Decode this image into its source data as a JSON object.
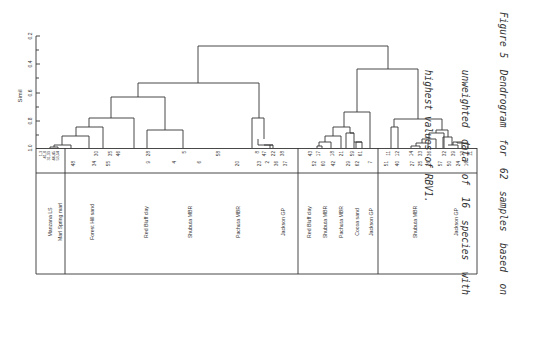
{
  "chart_data": {
    "type": "dendrogram",
    "title": "",
    "ylabel": "Simil",
    "xlabel": "",
    "yticks": [
      "0.2",
      "0.4",
      "0.6",
      "0.8",
      "1.0"
    ],
    "ylim": [
      0.2,
      1.0
    ],
    "grid": false,
    "orientation": "leaves at bottom; figure rotated 90° on page",
    "leaf_labels_row1": [
      "1,3,41,8,31,33,44,45,53,54",
      "30",
      "35",
      "46",
      "28",
      "5",
      "58",
      "8",
      "47",
      "22",
      "38",
      "43",
      "17",
      "18",
      "21",
      "59",
      "61",
      "11",
      "12",
      "14",
      "33",
      "36",
      "32",
      "39",
      "13",
      "11"
    ],
    "leaf_labels_row2": [
      "48",
      "34",
      "55",
      "9",
      "4",
      "6",
      "20",
      "23",
      "2",
      "36",
      "37",
      "52",
      "60",
      "42",
      "29",
      "62",
      "7",
      "51",
      "40",
      "27",
      "25",
      "26",
      "57",
      "50",
      "49",
      "58",
      "24",
      "16",
      "15"
    ],
    "groups": [
      {
        "section": "A",
        "label": "Manzana LS"
      },
      {
        "section": "A",
        "label": "Marl Spring marl"
      },
      {
        "section": "B",
        "label": "Forest Hill sand"
      },
      {
        "section": "B",
        "label": "Red Bluff clay"
      },
      {
        "section": "B",
        "label": "Shubuta MBR"
      },
      {
        "section": "B",
        "label": "Pachuta MBR"
      },
      {
        "section": "B",
        "label": "Jackson GP"
      },
      {
        "section": "C",
        "label": "Red Bluff clay"
      },
      {
        "section": "C",
        "label": "Shubuta MBR"
      },
      {
        "section": "C",
        "label": "Pachuta MBR"
      },
      {
        "section": "C",
        "label": "Cocoa sand"
      },
      {
        "section": "C",
        "label": "Jackson GP"
      },
      {
        "section": "D",
        "label": "Shubuta MBR"
      },
      {
        "section": "D",
        "label": "Jackson GP"
      }
    ],
    "major_merges": [
      {
        "description": "root (all samples)",
        "similarity": 0.27
      },
      {
        "description": "left cluster (sections A+B)",
        "similarity": 0.53
      },
      {
        "description": "right cluster (sections C+D)",
        "similarity": 0.43
      },
      {
        "description": "section C cluster",
        "similarity": 0.74
      },
      {
        "description": "section D cluster",
        "similarity": 0.78
      }
    ]
  },
  "axis": {
    "label": "Simil",
    "ticks": [
      "0.2",
      "0.4",
      "0.6",
      "0.8",
      "1.0"
    ]
  },
  "table": {
    "header_small": [
      "1,3",
      "41,8",
      "31,33",
      "44,45",
      "53,54"
    ],
    "row1": [
      {
        "x": 96,
        "t": "30"
      },
      {
        "x": 110,
        "t": "35"
      },
      {
        "x": 118,
        "t": "46"
      },
      {
        "x": 148,
        "t": "28"
      },
      {
        "x": 184,
        "t": "5"
      },
      {
        "x": 218,
        "t": "58"
      },
      {
        "x": 257,
        "t": "8"
      },
      {
        "x": 264,
        "t": "47"
      },
      {
        "x": 273,
        "t": "22"
      },
      {
        "x": 282,
        "t": "38"
      },
      {
        "x": 310,
        "t": "43"
      },
      {
        "x": 318,
        "t": "17"
      },
      {
        "x": 332,
        "t": "18"
      },
      {
        "x": 341,
        "t": "21"
      },
      {
        "x": 352,
        "t": "59"
      },
      {
        "x": 360,
        "t": "61"
      },
      {
        "x": 388,
        "t": "11"
      },
      {
        "x": 397,
        "t": "12"
      },
      {
        "x": 411,
        "t": "14"
      },
      {
        "x": 420,
        "t": "33"
      },
      {
        "x": 429,
        "t": "36"
      },
      {
        "x": 444,
        "t": "32"
      },
      {
        "x": 453,
        "t": "39"
      },
      {
        "x": 462,
        "t": "13"
      },
      {
        "x": 470,
        "t": "11"
      }
    ],
    "row2": [
      {
        "x": 73,
        "t": "48"
      },
      {
        "x": 94,
        "t": "34"
      },
      {
        "x": 108,
        "t": "55"
      },
      {
        "x": 148,
        "t": "9"
      },
      {
        "x": 174,
        "t": "4"
      },
      {
        "x": 199,
        "t": "6"
      },
      {
        "x": 237,
        "t": "20"
      },
      {
        "x": 259,
        "t": "23"
      },
      {
        "x": 267,
        "t": "2"
      },
      {
        "x": 276,
        "t": "36"
      },
      {
        "x": 285,
        "t": "37"
      },
      {
        "x": 314,
        "t": "52"
      },
      {
        "x": 323,
        "t": "60"
      },
      {
        "x": 333,
        "t": "42"
      },
      {
        "x": 348,
        "t": "29"
      },
      {
        "x": 357,
        "t": "62"
      },
      {
        "x": 370,
        "t": "7"
      },
      {
        "x": 386,
        "t": "51"
      },
      {
        "x": 397,
        "t": "40"
      },
      {
        "x": 412,
        "t": "27"
      },
      {
        "x": 420,
        "t": "25"
      },
      {
        "x": 428,
        "t": "26"
      },
      {
        "x": 440,
        "t": "57"
      },
      {
        "x": 449,
        "t": "50"
      },
      {
        "x": 458,
        "t": "24"
      },
      {
        "x": 466,
        "t": "16"
      }
    ],
    "groups": [
      {
        "x": 50,
        "label": "Manzana LS"
      },
      {
        "x": 60,
        "label": "Marl Spring marl"
      },
      {
        "x": 92,
        "label": "Forest Hill sand"
      },
      {
        "x": 146,
        "label": "Red Bluff clay"
      },
      {
        "x": 190,
        "label": "Shubuta MBR"
      },
      {
        "x": 238,
        "label": "Pachuta MBR"
      },
      {
        "x": 283,
        "label": "Jackson GP"
      },
      {
        "x": 309,
        "label": "Red Bluff clay"
      },
      {
        "x": 325,
        "label": "Shubuta MBR"
      },
      {
        "x": 341,
        "label": "Pachuta MBR"
      },
      {
        "x": 357,
        "label": "Cocoa sand"
      },
      {
        "x": 371,
        "label": "Jackson GP"
      },
      {
        "x": 415,
        "label": "Shubuta MBR"
      },
      {
        "x": 456,
        "label": "Jackson GP"
      }
    ]
  },
  "caption": {
    "line1": "Figure 5  Dendrogram  for  62  samples  based  on",
    "line2": "          unweighted  data  of  16  species  with",
    "line3": "          highest values of RBV1."
  }
}
